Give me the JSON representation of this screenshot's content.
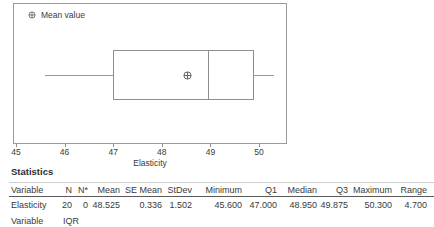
{
  "chart": {
    "legend_label": "Mean value",
    "xlabel": "Elasticity"
  },
  "chart_data": {
    "type": "boxplot",
    "orientation": "horizontal",
    "variable": "Elasticity",
    "xlabel": "Elasticity",
    "x_ticks": [
      45,
      46,
      47,
      48,
      49,
      50
    ],
    "xlim": [
      45,
      50.6
    ],
    "legend": [
      "Mean value"
    ],
    "stats": {
      "minimum": 45.6,
      "q1": 47.0,
      "median": 48.95,
      "q3": 49.875,
      "maximum": 50.3,
      "mean": 48.525
    }
  },
  "statistics": {
    "title": "Statistics",
    "table": {
      "headers": [
        "Variable",
        "N",
        "N*",
        "Mean",
        "SE Mean",
        "StDev",
        "Minimum",
        "Q1",
        "Median",
        "Q3",
        "Maximum",
        "Range"
      ],
      "rows": [
        [
          "Elasticity",
          "20",
          "0",
          "48.525",
          "0.336",
          "1.502",
          "45.600",
          "47.000",
          "48.950",
          "49.875",
          "50.300",
          "4.700"
        ]
      ]
    },
    "continuation": {
      "headers": [
        "Variable",
        "IQR"
      ]
    }
  }
}
